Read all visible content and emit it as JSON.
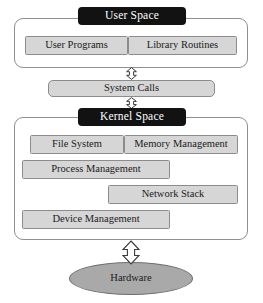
{
  "diagram": {
    "colors": {
      "box_fill": "#d6d6d6",
      "box_border": "#8c8c8c",
      "banner_fill": "#121212",
      "banner_text": "#ffffff",
      "ellipse_fill": "#a9a9a9",
      "ellipse_border": "#6f6f6f",
      "container_border": "#8f8f8f",
      "background": "#ffffff",
      "text": "#1a1a1a"
    },
    "user_space": {
      "banner_label": "User Space",
      "components": [
        {
          "label": "User Programs"
        },
        {
          "label": "Library Routines"
        }
      ]
    },
    "system_calls": {
      "label": "System Calls"
    },
    "kernel_space": {
      "banner_label": "Kernel Space",
      "components": [
        {
          "label": "File System"
        },
        {
          "label": "Memory Management"
        },
        {
          "label": "Process Management"
        },
        {
          "label": "Network Stack"
        },
        {
          "label": "Device Management"
        }
      ]
    },
    "hardware": {
      "label": "Hardware"
    },
    "connectors": [
      {
        "name": "user-space-to-system-calls",
        "type": "double-headed-vertical-arrow"
      },
      {
        "name": "system-calls-to-kernel-space",
        "type": "double-headed-vertical-arrow"
      },
      {
        "name": "kernel-space-to-hardware",
        "type": "double-headed-vertical-arrow"
      }
    ]
  }
}
